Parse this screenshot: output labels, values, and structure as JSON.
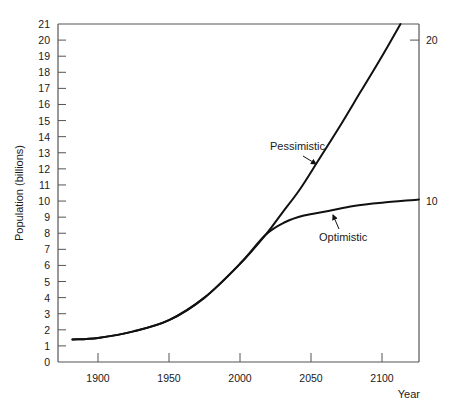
{
  "chart_data": {
    "type": "line",
    "title": "",
    "xlabel": "Year",
    "ylabel": "Population (billions)",
    "xlim": [
      1868,
      2126
    ],
    "ylim": [
      0,
      21
    ],
    "grid": false,
    "legend": "none (curves annotated inline)",
    "x_ticks": [
      1900,
      1950,
      2000,
      2050,
      2100
    ],
    "y_ticks": [
      0,
      1,
      2,
      3,
      4,
      5,
      6,
      7,
      8,
      9,
      10,
      11,
      12,
      13,
      14,
      15,
      16,
      17,
      18,
      19,
      20,
      21
    ],
    "right_axis_labels": [
      {
        "value": 20,
        "label": "20"
      },
      {
        "value": 10,
        "label": "10"
      }
    ],
    "series": [
      {
        "name": "Pessimistic",
        "points": [
          [
            1882,
            1.4
          ],
          [
            1900,
            1.5
          ],
          [
            1925,
            1.9
          ],
          [
            1950,
            2.6
          ],
          [
            1975,
            4.0
          ],
          [
            2000,
            6.1
          ],
          [
            2018,
            7.9
          ],
          [
            2030,
            9.3
          ],
          [
            2042,
            10.7
          ],
          [
            2055,
            12.5
          ],
          [
            2070,
            14.6
          ],
          [
            2085,
            16.8
          ],
          [
            2100,
            19.0
          ],
          [
            2113,
            21.0
          ]
        ]
      },
      {
        "name": "Optimistic",
        "points": [
          [
            1882,
            1.4
          ],
          [
            1900,
            1.5
          ],
          [
            1925,
            1.9
          ],
          [
            1950,
            2.6
          ],
          [
            1975,
            4.0
          ],
          [
            2000,
            6.1
          ],
          [
            2018,
            7.9
          ],
          [
            2032,
            8.7
          ],
          [
            2045,
            9.1
          ],
          [
            2063,
            9.4
          ],
          [
            2080,
            9.7
          ],
          [
            2100,
            9.9
          ],
          [
            2126,
            10.1
          ]
        ]
      }
    ],
    "annotations": [
      {
        "text": "Pessimistic",
        "points_to": "Pessimistic"
      },
      {
        "text": "Optimistic",
        "points_to": "Optimistic"
      }
    ]
  }
}
